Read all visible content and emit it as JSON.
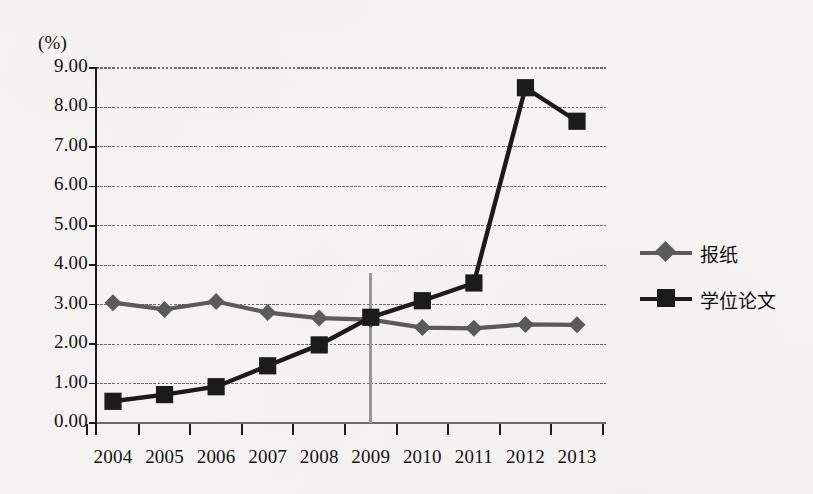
{
  "chart_data": {
    "type": "line",
    "title": "",
    "xlabel": "",
    "ylabel": "(%)",
    "categories": [
      "2004",
      "2005",
      "2006",
      "2007",
      "2008",
      "2009",
      "2010",
      "2011",
      "2012",
      "2013"
    ],
    "ylim": [
      0.0,
      9.0
    ],
    "ytick_step": 1.0,
    "ytick_labels": [
      "9.00",
      "8.00",
      "7.00",
      "6.00",
      "5.00",
      "4.00",
      "3.00",
      "2.00",
      "1.00",
      "0.00"
    ],
    "grid": "horizontal",
    "legend_position": "right",
    "annotations": [
      {
        "name": "vertical-reference-line-2009",
        "category": "2009",
        "y_from": 0.0,
        "y_to": 3.8,
        "color": "#9a9a9a"
      }
    ],
    "series": [
      {
        "name": "报纸",
        "marker": "diamond",
        "color": "#5c5c5c",
        "values": [
          3.05,
          2.88,
          3.08,
          2.8,
          2.66,
          2.62,
          2.42,
          2.4,
          2.5,
          2.49
        ]
      },
      {
        "name": "学位论文",
        "marker": "square",
        "color": "#1b1b1b",
        "values": [
          0.55,
          0.72,
          0.92,
          1.45,
          1.98,
          2.68,
          3.1,
          3.55,
          8.5,
          7.65
        ]
      }
    ]
  },
  "axis": {
    "unit_label": "(%)"
  },
  "legend": {
    "items": [
      {
        "label": "报纸",
        "color": "#5c5c5c",
        "marker": "diamond"
      },
      {
        "label": "学位论文",
        "color": "#1b1b1b",
        "marker": "square"
      }
    ]
  },
  "colors": {
    "background": "#f8f7f5",
    "axis": "#1a1a1a",
    "gridline": "#6e6e6e",
    "series_newspaper": "#5c5c5c",
    "series_thesis": "#1b1b1b",
    "reference_line": "#9a9a9a"
  }
}
